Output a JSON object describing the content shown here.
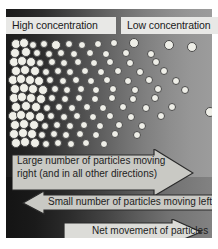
{
  "figure": {
    "type": "diffusion-diagram"
  },
  "labels": {
    "high_concentration": "High concentration",
    "low_concentration": "Low concentration"
  },
  "arrows": [
    {
      "name": "large-number-right",
      "direction": "right",
      "line1": "Large number of particles moving",
      "line2": "right (and in all other directions)"
    },
    {
      "name": "small-number-left",
      "direction": "left",
      "line1": "Small number of particles moving left"
    },
    {
      "name": "net-movement",
      "direction": "right",
      "line1": "Net movement of particles"
    }
  ],
  "colors": {
    "panel_dark": "#1b1b1b",
    "panel_light": "#9c9c9c",
    "label_background": "#e8e8e6",
    "label_text": "#1a1a1a",
    "arrow_fill": "#c9c9c4",
    "arrow_stroke": "#2a2a2a",
    "particle_fill": "#efefe8",
    "particle_stroke": "#4a4a4a"
  },
  "chart_data": {
    "type": "scatter",
    "xlabel": "",
    "ylabel": "",
    "particles": [
      [
        10,
        44,
        5
      ],
      [
        18,
        43,
        5
      ],
      [
        27,
        45,
        4
      ],
      [
        38,
        44,
        4
      ],
      [
        50,
        45,
        5
      ],
      [
        63,
        44,
        4
      ],
      [
        76,
        45,
        4
      ],
      [
        92,
        44,
        4
      ],
      [
        108,
        43,
        4
      ],
      [
        128,
        43,
        5
      ],
      [
        163,
        45,
        5
      ],
      [
        9,
        53,
        5
      ],
      [
        20,
        52,
        5
      ],
      [
        31,
        53,
        4
      ],
      [
        43,
        54,
        4
      ],
      [
        55,
        53,
        4
      ],
      [
        68,
        54,
        4
      ],
      [
        84,
        53,
        4
      ],
      [
        100,
        54,
        4
      ],
      [
        120,
        53,
        4
      ],
      [
        145,
        54,
        4
      ],
      [
        186,
        47,
        5
      ],
      [
        8,
        62,
        5
      ],
      [
        16,
        61,
        5
      ],
      [
        25,
        62,
        5
      ],
      [
        34,
        63,
        4
      ],
      [
        46,
        62,
        4
      ],
      [
        58,
        63,
        4
      ],
      [
        72,
        62,
        4
      ],
      [
        88,
        63,
        4
      ],
      [
        104,
        62,
        4
      ],
      [
        124,
        63,
        4
      ],
      [
        150,
        62,
        4
      ],
      [
        10,
        71,
        5
      ],
      [
        19,
        70,
        5
      ],
      [
        29,
        71,
        5
      ],
      [
        40,
        72,
        4
      ],
      [
        52,
        71,
        4
      ],
      [
        64,
        72,
        4
      ],
      [
        79,
        71,
        4
      ],
      [
        95,
        72,
        4
      ],
      [
        112,
        71,
        4
      ],
      [
        134,
        72,
        4
      ],
      [
        158,
        71,
        4
      ],
      [
        7,
        80,
        5
      ],
      [
        15,
        79,
        5
      ],
      [
        24,
        80,
        5
      ],
      [
        33,
        81,
        5
      ],
      [
        44,
        80,
        4
      ],
      [
        57,
        81,
        4
      ],
      [
        70,
        80,
        4
      ],
      [
        85,
        81,
        4
      ],
      [
        101,
        80,
        4
      ],
      [
        122,
        81,
        4
      ],
      [
        143,
        80,
        4
      ],
      [
        170,
        81,
        4
      ],
      [
        9,
        89,
        5
      ],
      [
        18,
        88,
        5
      ],
      [
        27,
        89,
        5
      ],
      [
        37,
        90,
        5
      ],
      [
        49,
        89,
        4
      ],
      [
        61,
        90,
        4
      ],
      [
        75,
        89,
        4
      ],
      [
        90,
        90,
        4
      ],
      [
        107,
        89,
        4
      ],
      [
        129,
        90,
        4
      ],
      [
        152,
        89,
        4
      ],
      [
        179,
        90,
        4
      ],
      [
        8,
        98,
        5
      ],
      [
        16,
        97,
        5
      ],
      [
        25,
        98,
        5
      ],
      [
        35,
        99,
        5
      ],
      [
        46,
        98,
        4
      ],
      [
        59,
        99,
        4
      ],
      [
        73,
        98,
        4
      ],
      [
        89,
        99,
        4
      ],
      [
        106,
        98,
        4
      ],
      [
        127,
        99,
        4
      ],
      [
        149,
        98,
        4
      ],
      [
        10,
        107,
        5
      ],
      [
        20,
        106,
        5
      ],
      [
        30,
        107,
        5
      ],
      [
        41,
        108,
        4
      ],
      [
        53,
        107,
        4
      ],
      [
        66,
        108,
        4
      ],
      [
        81,
        107,
        4
      ],
      [
        97,
        108,
        4
      ],
      [
        117,
        107,
        4
      ],
      [
        140,
        108,
        4
      ],
      [
        166,
        107,
        4
      ],
      [
        7,
        116,
        5
      ],
      [
        15,
        115,
        5
      ],
      [
        24,
        116,
        5
      ],
      [
        34,
        117,
        5
      ],
      [
        45,
        116,
        4
      ],
      [
        58,
        117,
        4
      ],
      [
        71,
        116,
        4
      ],
      [
        87,
        117,
        4
      ],
      [
        104,
        116,
        4
      ],
      [
        125,
        117,
        4
      ],
      [
        155,
        116,
        4
      ],
      [
        204,
        112,
        5
      ],
      [
        9,
        125,
        5
      ],
      [
        18,
        124,
        5
      ],
      [
        28,
        125,
        5
      ],
      [
        39,
        126,
        4
      ],
      [
        51,
        125,
        4
      ],
      [
        64,
        126,
        4
      ],
      [
        78,
        125,
        4
      ],
      [
        94,
        126,
        4
      ],
      [
        113,
        125,
        4
      ],
      [
        136,
        126,
        4
      ],
      [
        8,
        134,
        5
      ],
      [
        17,
        133,
        5
      ],
      [
        26,
        134,
        5
      ],
      [
        36,
        135,
        4
      ],
      [
        48,
        134,
        4
      ],
      [
        60,
        135,
        4
      ],
      [
        74,
        134,
        4
      ],
      [
        90,
        135,
        4
      ],
      [
        109,
        134,
        4
      ],
      [
        131,
        135,
        4
      ],
      [
        10,
        143,
        5
      ],
      [
        19,
        142,
        5
      ],
      [
        29,
        143,
        5
      ],
      [
        40,
        144,
        4
      ],
      [
        52,
        143,
        4
      ],
      [
        65,
        144,
        4
      ],
      [
        80,
        143,
        4
      ],
      [
        98,
        144,
        4
      ],
      [
        12,
        172,
        5
      ],
      [
        22,
        171,
        5
      ],
      [
        33,
        172,
        4
      ],
      [
        46,
        173,
        4
      ]
    ]
  }
}
